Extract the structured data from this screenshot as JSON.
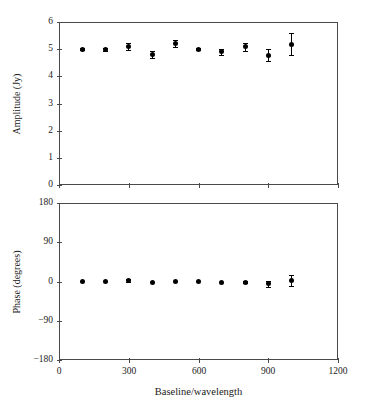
{
  "figure": {
    "width": 369,
    "height": 410,
    "background": "#ffffff",
    "ink_color": "#1a1a1a",
    "marker_color": "#000000",
    "axis_color": "#4a4a4a"
  },
  "chart_data": [
    {
      "type": "scatter",
      "panel": "top",
      "title": "",
      "xlabel": "",
      "ylabel": "Amplitude (Jy)",
      "xlim": [
        0,
        1200
      ],
      "ylim": [
        0,
        6
      ],
      "xticks": [
        0,
        300,
        600,
        900,
        1200
      ],
      "xticklabels": [
        "",
        "",
        "",
        "",
        ""
      ],
      "yticks": [
        0,
        1,
        2,
        3,
        4,
        5,
        6
      ],
      "yticklabels": [
        "0",
        "1",
        "2",
        "3",
        "4",
        "5",
        "6"
      ],
      "grid": false,
      "legend": "none",
      "x": [
        100,
        200,
        300,
        400,
        500,
        600,
        700,
        800,
        900,
        1000
      ],
      "values": [
        5.0,
        5.0,
        5.1,
        4.8,
        5.2,
        5.0,
        4.9,
        5.08,
        4.78,
        5.18
      ],
      "yerr": [
        0.04,
        0.05,
        0.12,
        0.14,
        0.12,
        0.04,
        0.12,
        0.14,
        0.22,
        0.4
      ]
    },
    {
      "type": "scatter",
      "panel": "bottom",
      "title": "",
      "xlabel": "Baseline/wavelength",
      "ylabel": "Phase (degrees)",
      "xlim": [
        0,
        1200
      ],
      "ylim": [
        -180,
        180
      ],
      "xticks": [
        0,
        300,
        600,
        900,
        1200
      ],
      "xticklabels": [
        "0",
        "300",
        "600",
        "900",
        "1200"
      ],
      "yticks": [
        -180,
        -90,
        0,
        90,
        180
      ],
      "yticklabels": [
        "−180",
        "−90",
        "0",
        "90",
        "180"
      ],
      "grid": false,
      "legend": "none",
      "x": [
        100,
        200,
        300,
        400,
        500,
        600,
        700,
        800,
        900,
        1000
      ],
      "values": [
        0,
        0.5,
        2.0,
        -1.5,
        0,
        1.0,
        -2.5,
        -1.5,
        -5.0,
        2.5
      ],
      "yerr": [
        1.5,
        1.5,
        4.0,
        2.0,
        1.5,
        1.5,
        2.0,
        3.0,
        7.0,
        12.0
      ]
    }
  ]
}
